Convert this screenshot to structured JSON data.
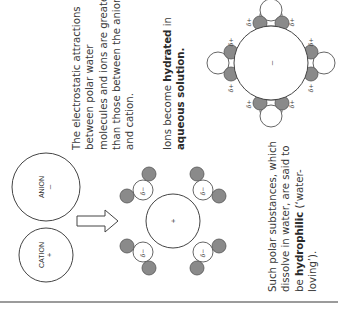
{
  "ions": {
    "cation": {
      "label": "CATION",
      "sign": "+"
    },
    "anion": {
      "label": "ANION",
      "sign": "–"
    }
  },
  "hydrated_cation": {
    "sign": "+",
    "oxygen_charge": "δ−"
  },
  "hydrated_anion": {
    "sign": "–",
    "hydrogen_charge": "δ+"
  },
  "text": {
    "attraction": [
      "The electrostatic attractions",
      "between polar water",
      "molecules and ions are greater",
      "than those between the anion",
      "and cation."
    ],
    "hydrated": {
      "line1_pre": "Ions become ",
      "line1_bold": "hydrated",
      "line1_post": " in",
      "line2_bold": "aqueous solution."
    },
    "hydrophilic": {
      "line1": "Such polar substances, which",
      "line2": "dissolve in water, are said to",
      "line3_pre": "be ",
      "line3_bold": "hydrophilic",
      "line3_post": " (‘water-",
      "line4": "loving’)."
    }
  },
  "colors": {
    "hydrogen_fill": "#8a8a8a",
    "rule": "#7a7a7a",
    "text": "#3a3a3a"
  }
}
